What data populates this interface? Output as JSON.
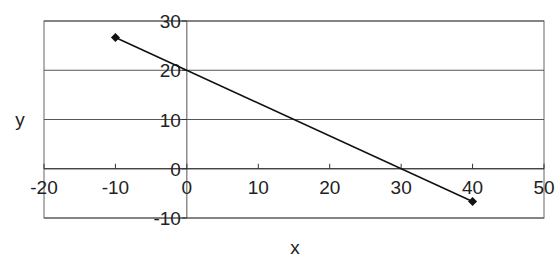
{
  "chart_data": {
    "type": "scatter",
    "subtype": "scatter-with-straight-lines-and-markers",
    "title": "",
    "xlabel": "x",
    "ylabel": "y",
    "xlim": [
      -20,
      50
    ],
    "ylim": [
      -10,
      30
    ],
    "x_ticks": [
      -20,
      -10,
      0,
      10,
      20,
      30,
      40,
      50
    ],
    "y_ticks": [
      -10,
      0,
      10,
      20,
      30
    ],
    "x_tick_labels": [
      "-20",
      "-10",
      "0",
      "10",
      "20",
      "30",
      "40",
      "50"
    ],
    "y_tick_labels": [
      "-10",
      "0",
      "10",
      "20",
      "30"
    ],
    "grid": {
      "horizontal": true,
      "vertical": false
    },
    "legend": null,
    "series": [
      {
        "name": "y",
        "x": [
          -10,
          40
        ],
        "y": [
          26.67,
          -6.67
        ],
        "marker": "diamond",
        "color": "#111111"
      }
    ],
    "annotations": []
  },
  "colors": {
    "line": "#111111",
    "grid": "#555555",
    "border": "#666666",
    "text": "#222222"
  }
}
